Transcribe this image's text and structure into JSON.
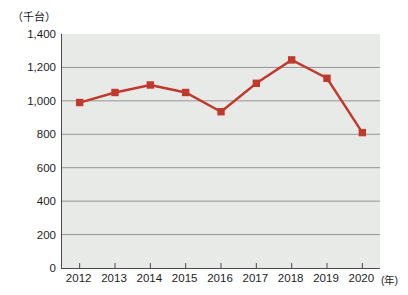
{
  "chart_data": {
    "type": "line",
    "title": "",
    "subtitle": "",
    "xlabel": "年",
    "ylabel": "千台",
    "unit_label": "（千台）",
    "x_unit_label": "(年)",
    "categories": [
      "2012",
      "2013",
      "2014",
      "2015",
      "2016",
      "2017",
      "2018",
      "2019",
      "2020"
    ],
    "values": [
      990,
      1050,
      1095,
      1050,
      935,
      1105,
      1245,
      1135,
      810
    ],
    "series": [
      {
        "name": "",
        "values": [
          990,
          1050,
          1095,
          1050,
          935,
          1105,
          1245,
          1135,
          810
        ]
      }
    ],
    "ylim": [
      0,
      1400
    ],
    "y_ticks": [
      0,
      200,
      400,
      600,
      800,
      1000,
      1200,
      1400
    ],
    "y_tick_labels": [
      "0",
      "200",
      "400",
      "600",
      "800",
      "1,000",
      "1,200",
      "1,400"
    ],
    "grid": true,
    "legend": "none",
    "marker": "square",
    "colors": {
      "line": "#c0392b",
      "marker": "#c0392b",
      "plot_background": "#e8eae8",
      "gridline": "#8a8a8a",
      "axis": "#4a4a4a",
      "text": "#1d1d1d"
    }
  }
}
